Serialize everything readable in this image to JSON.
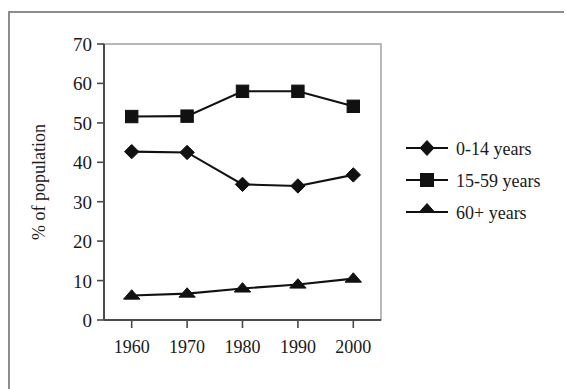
{
  "chart_data": {
    "type": "line",
    "title": "",
    "subtitle": "",
    "xlabel": "",
    "ylabel": "% of population",
    "x": [
      1960,
      1970,
      1980,
      1990,
      2000
    ],
    "categories": [
      "1960",
      "1970",
      "1980",
      "1990",
      "2000"
    ],
    "xtick_labels": [
      "1960",
      "1970",
      "1980",
      "1990",
      "2000"
    ],
    "ytick_labels": [
      "0",
      "10",
      "20",
      "30",
      "40",
      "50",
      "60",
      "70"
    ],
    "ytick_values": [
      0,
      10,
      20,
      30,
      40,
      50,
      60,
      70
    ],
    "ylim": [
      0,
      70
    ],
    "xlim": [
      1955,
      2005
    ],
    "grid": false,
    "legend_position": "right",
    "series": [
      {
        "name": "0-14 years",
        "marker": "diamond",
        "color": "#111111",
        "values": [
          42.7,
          42.5,
          34.4,
          34.0,
          36.8
        ]
      },
      {
        "name": "15-59 years",
        "marker": "square",
        "color": "#111111",
        "values": [
          51.6,
          51.7,
          58.0,
          58.0,
          54.2
        ]
      },
      {
        "name": "60+ years",
        "marker": "triangle",
        "color": "#111111",
        "values": [
          6.2,
          6.7,
          8.0,
          9.0,
          10.5
        ]
      }
    ]
  },
  "legend": {
    "entries": [
      {
        "label": "0-14 years",
        "marker": "diamond"
      },
      {
        "label": "15-59 years",
        "marker": "square"
      },
      {
        "label": "60+ years",
        "marker": "triangle"
      }
    ]
  },
  "axes": {
    "y_title": "% of population"
  }
}
